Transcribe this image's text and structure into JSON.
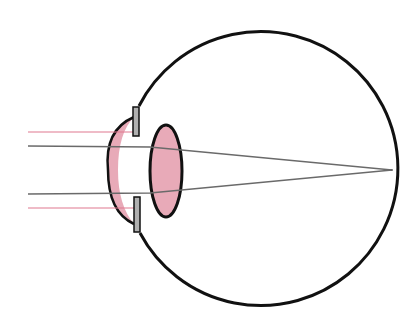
{
  "diagram": {
    "colors": {
      "outline": "#111111",
      "tissue_fill": "#e8aab8",
      "iris_fill": "#b0b0b0",
      "light_ray": "#e07890",
      "axis_ray": "#6a6a6a",
      "background": "#ffffff"
    },
    "eyeball": {
      "cx": 257,
      "cy": 170,
      "r": 137
    },
    "lens": {
      "cx": 166,
      "cy": 171,
      "rx": 16,
      "ry": 46
    },
    "iris": [
      {
        "x": 133,
        "y": 107,
        "w": 6,
        "h": 29
      },
      {
        "x": 134,
        "y": 197,
        "w": 6,
        "h": 35
      }
    ],
    "focal_point": {
      "x": 392,
      "y": 170
    },
    "rays": [
      {
        "type": "peripheral",
        "y": 132,
        "x1": 28,
        "x2": 134
      },
      {
        "type": "central",
        "y": 146,
        "x1": 28
      },
      {
        "type": "central",
        "y": 194,
        "x1": 28
      },
      {
        "type": "peripheral",
        "y": 208,
        "x1": 28,
        "x2": 134
      }
    ],
    "caption": ""
  }
}
